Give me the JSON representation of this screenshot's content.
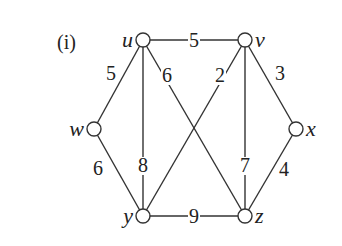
{
  "panel_label": "(i)",
  "graph": {
    "nodes": [
      {
        "id": "u",
        "label": "u",
        "x": 143,
        "y": 40,
        "lx": 133,
        "ly": 47,
        "anchor": "end"
      },
      {
        "id": "v",
        "label": "v",
        "x": 245,
        "y": 40,
        "lx": 255,
        "ly": 47,
        "anchor": "start"
      },
      {
        "id": "w",
        "label": "w",
        "x": 94,
        "y": 129,
        "lx": 84,
        "ly": 136,
        "anchor": "end"
      },
      {
        "id": "x",
        "label": "x",
        "x": 296,
        "y": 129,
        "lx": 306,
        "ly": 136,
        "anchor": "start"
      },
      {
        "id": "y",
        "label": "y",
        "x": 143,
        "y": 216,
        "lx": 133,
        "ly": 223,
        "anchor": "end"
      },
      {
        "id": "z",
        "label": "z",
        "x": 245,
        "y": 216,
        "lx": 255,
        "ly": 223,
        "anchor": "start"
      }
    ],
    "edges": [
      {
        "from": "u",
        "to": "v",
        "weight": "5",
        "lx": 194,
        "ly": 47
      },
      {
        "from": "u",
        "to": "w",
        "weight": "5",
        "lx": 111,
        "ly": 80
      },
      {
        "from": "u",
        "to": "y",
        "weight": "8",
        "lx": 143,
        "ly": 172
      },
      {
        "from": "u",
        "to": "z",
        "weight": "6",
        "lx": 167,
        "ly": 82
      },
      {
        "from": "v",
        "to": "y",
        "weight": "2",
        "lx": 220,
        "ly": 82
      },
      {
        "from": "v",
        "to": "z",
        "weight": "7",
        "lx": 245,
        "ly": 172
      },
      {
        "from": "v",
        "to": "x",
        "weight": "3",
        "lx": 280,
        "ly": 80
      },
      {
        "from": "w",
        "to": "y",
        "weight": "6",
        "lx": 98,
        "ly": 175
      },
      {
        "from": "x",
        "to": "z",
        "weight": "4",
        "lx": 284,
        "ly": 176
      },
      {
        "from": "y",
        "to": "z",
        "weight": "9",
        "lx": 194,
        "ly": 223
      }
    ]
  },
  "colors": {
    "stroke": "#333333",
    "node_fill": "#ffffff",
    "text": "#222222"
  }
}
